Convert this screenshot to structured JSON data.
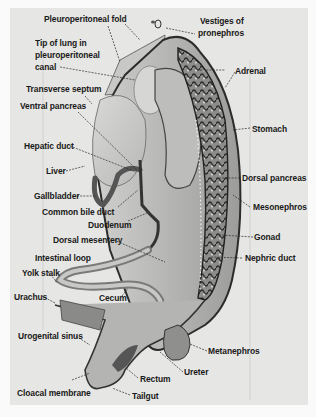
{
  "figure": {
    "colors": {
      "background": "#e6e6e4",
      "tissue_light": "#d2d2d0",
      "tissue_mid": "#a8a8a6",
      "tissue_dark": "#3a3a3a",
      "label_text": "#1a1a1a"
    }
  },
  "labels": [
    {
      "id": "pleuroperitoneal-fold",
      "text": "Pleuroperitoneal fold"
    },
    {
      "id": "vestiges-of-pronephros-1",
      "text": "Vestiges of"
    },
    {
      "id": "vestiges-of-pronephros-2",
      "text": "pronephros"
    },
    {
      "id": "tip-of-lung-1",
      "text": "Tip of lung in"
    },
    {
      "id": "tip-of-lung-2",
      "text": "pleuroperitoneal"
    },
    {
      "id": "tip-of-lung-3",
      "text": "canal"
    },
    {
      "id": "adrenal",
      "text": "Adrenal"
    },
    {
      "id": "transverse-septum",
      "text": "Transverse septum"
    },
    {
      "id": "ventral-pancreas",
      "text": "Ventral pancreas"
    },
    {
      "id": "stomach",
      "text": "Stomach"
    },
    {
      "id": "hepatic-duct",
      "text": "Hepatic duct"
    },
    {
      "id": "liver",
      "text": "Liver"
    },
    {
      "id": "dorsal-pancreas",
      "text": "Dorsal pancreas"
    },
    {
      "id": "gallbladder",
      "text": "Gallbladder"
    },
    {
      "id": "mesonephros",
      "text": "Mesonephros"
    },
    {
      "id": "common-bile-duct",
      "text": "Common bile duct"
    },
    {
      "id": "duodenum",
      "text": "Duodenum"
    },
    {
      "id": "gonad",
      "text": "Gonad"
    },
    {
      "id": "dorsal-mesentery",
      "text": "Dorsal mesentery"
    },
    {
      "id": "intestinal-loop",
      "text": "Intestinal loop"
    },
    {
      "id": "nephric-duct",
      "text": "Nephric duct"
    },
    {
      "id": "yolk-stalk",
      "text": "Yolk stalk"
    },
    {
      "id": "urachus",
      "text": "Urachus"
    },
    {
      "id": "cecum",
      "text": "Cecum"
    },
    {
      "id": "urogenital-sinus",
      "text": "Urogenital sinus"
    },
    {
      "id": "metanephros",
      "text": "Metanephros"
    },
    {
      "id": "ureter",
      "text": "Ureter"
    },
    {
      "id": "rectum",
      "text": "Rectum"
    },
    {
      "id": "cloacal-membrane",
      "text": "Cloacal membrane"
    },
    {
      "id": "tailgut",
      "text": "Tailgut"
    }
  ]
}
